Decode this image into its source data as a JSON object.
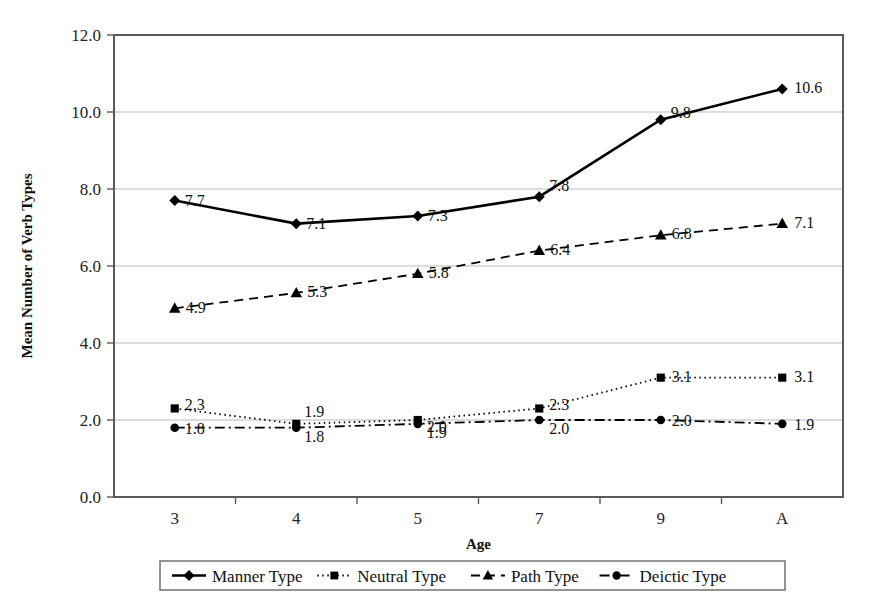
{
  "chart_data": {
    "type": "line",
    "title": "",
    "xlabel": "Age",
    "ylabel": "Mean Number of Verb Types",
    "categories": [
      "3",
      "4",
      "5",
      "7",
      "9",
      "A"
    ],
    "ylim": [
      0,
      12
    ],
    "ytick_labels": [
      "0.0",
      "2.0",
      "4.0",
      "6.0",
      "8.0",
      "10.0",
      "12.0"
    ],
    "ytick_values": [
      0,
      2,
      4,
      6,
      8,
      10,
      12
    ],
    "grid": "horizontal",
    "legend_position": "bottom",
    "series": [
      {
        "name": "Manner Type",
        "marker": "diamond",
        "linestyle": "solid",
        "values": [
          7.7,
          7.1,
          7.3,
          7.8,
          9.8,
          10.6
        ],
        "labels": [
          "7.7",
          "7.1",
          "7.3",
          "7.8",
          "9.8",
          "10.6"
        ]
      },
      {
        "name": "Neutral Type",
        "marker": "square",
        "linestyle": "dotted",
        "values": [
          2.3,
          1.9,
          2.0,
          2.3,
          3.1,
          3.1
        ],
        "labels": [
          "2.3",
          "1.9",
          "2.0",
          "2.3",
          "3.1",
          "3.1"
        ]
      },
      {
        "name": "Path Type",
        "marker": "triangle",
        "linestyle": "dashed",
        "values": [
          4.9,
          5.3,
          5.8,
          6.4,
          6.8,
          7.1
        ],
        "labels": [
          "4.9",
          "5.3",
          "5.8",
          "6.4",
          "6.8",
          "7.1"
        ]
      },
      {
        "name": "Deictic Type",
        "marker": "circle",
        "linestyle": "dashdot",
        "values": [
          1.8,
          1.8,
          1.9,
          2.0,
          2.0,
          1.9
        ],
        "labels": [
          "1.8",
          "1.8",
          "1.9",
          "2.0",
          "2.0",
          "1.9"
        ]
      }
    ]
  },
  "colors": {
    "ink": "#000000",
    "grid": "#b9b9b9",
    "axis": "#5a5a5a",
    "background": "#ffffff"
  }
}
